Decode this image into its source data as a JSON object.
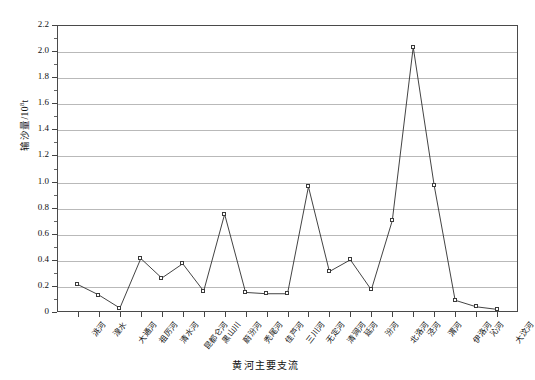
{
  "chart_data": {
    "type": "line",
    "title": "",
    "xlabel": "黄河主要支流",
    "ylabel": "输沙量/10",
    "ylabel_sup": "8",
    "ylabel_unit": "t",
    "ylim": [
      0,
      2.2
    ],
    "ytick_step": 0.2,
    "yticks": [
      "0",
      "0.2",
      "0.4",
      "0.6",
      "0.8",
      "1.0",
      "1.2",
      "1.4",
      "1.6",
      "1.8",
      "2.0",
      "2.2"
    ],
    "grid": true,
    "legend": "none",
    "marker": "open-square",
    "line_color": "#2e2e2e",
    "grid_color": "#b9b9b9",
    "categories": [
      "洮河",
      "湟水",
      "大通河",
      "祖厉河",
      "清水河",
      "昆都仑河",
      "黑山川",
      "蔚汾河",
      "秃尾河",
      "佳芦河",
      "三川河",
      "无定河",
      "清涧河",
      "延河",
      "汾河",
      "北洛河",
      "泾河",
      "渭河",
      "伊洛河",
      "沁河",
      "大汶河"
    ],
    "values": [
      0.21,
      0.13,
      0.03,
      0.41,
      0.26,
      0.37,
      0.16,
      0.75,
      0.15,
      0.14,
      0.14,
      0.96,
      0.31,
      0.4,
      0.17,
      0.7,
      2.03,
      0.97,
      0.09,
      0.04,
      0.02
    ]
  }
}
